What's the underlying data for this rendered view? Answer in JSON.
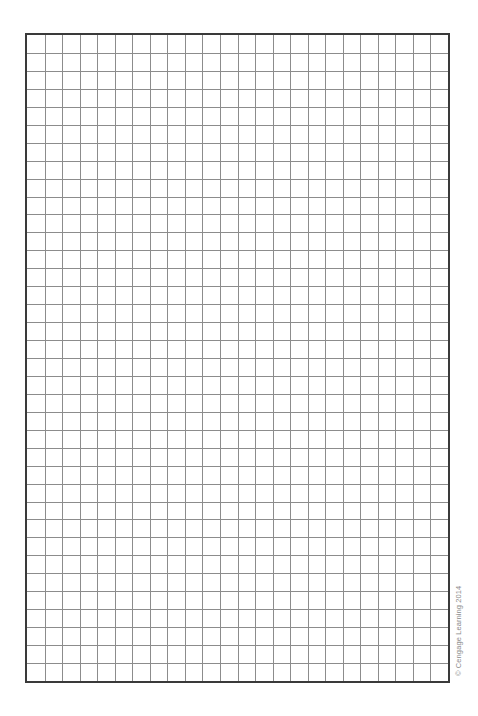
{
  "document": {
    "type": "graph-paper",
    "grid": {
      "columns": 24,
      "rows": 36,
      "line_color": "#8c8c8c",
      "border_color": "#3a3a3a"
    },
    "copyright": "© Cengage Learning 2014"
  }
}
